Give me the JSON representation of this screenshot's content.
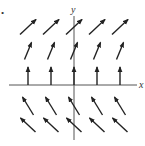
{
  "figure": {
    "type": "direction-field",
    "corner_mark": "•",
    "axes": {
      "x_label": "x",
      "y_label": "y",
      "origin_px": [
        74,
        85
      ],
      "x_range_px": [
        9,
        137
      ],
      "y_range_px": [
        8,
        140
      ]
    },
    "colors": {
      "arrow": "#222222",
      "axis": "#555555",
      "background": "#ffffff"
    },
    "columns_px": [
      28,
      51,
      74,
      97,
      120
    ],
    "rows": [
      {
        "name": "row-1",
        "y_center_px": 27,
        "dx": 16,
        "dy": -15,
        "direction": "up-right, slope ~1"
      },
      {
        "name": "row-2",
        "y_center_px": 51,
        "dx": 7,
        "dy": -17,
        "direction": "up-right, steep"
      },
      {
        "name": "row-3",
        "y_center_px": 76,
        "dx": 0,
        "dy": -18,
        "direction": "vertical up (on x-axis)",
        "anchored_to_axis": true
      },
      {
        "name": "row-4",
        "y_center_px": 106,
        "dx": -11,
        "dy": -18,
        "direction": "up-left, steep"
      },
      {
        "name": "row-5",
        "y_center_px": 125,
        "dx": -15,
        "dy": -14,
        "direction": "up-left, slope ~-1"
      }
    ]
  }
}
